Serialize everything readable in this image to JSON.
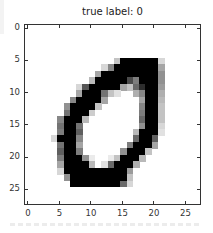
{
  "chart_data": {
    "type": "heatmap",
    "title": "true label: 0",
    "xlabel": "",
    "ylabel": "",
    "colormap": "gray_r",
    "shape": [
      28,
      28
    ],
    "x_ticks": [
      0,
      5,
      10,
      15,
      20,
      25
    ],
    "y_ticks": [
      0,
      5,
      10,
      15,
      20,
      25
    ],
    "xlim": [
      -0.5,
      27.5
    ],
    "ylim": [
      27.5,
      -0.5
    ],
    "grid": false,
    "legend": null,
    "sparse_pixels": {
      "5": {
        "14": 60,
        "15": 255,
        "16": 255,
        "17": 255,
        "18": 255,
        "19": 255,
        "20": 255,
        "21": 40
      },
      "6": {
        "12": 40,
        "13": 120,
        "14": 255,
        "15": 255,
        "16": 255,
        "17": 255,
        "18": 255,
        "19": 255,
        "20": 255,
        "21": 90
      },
      "7": {
        "11": 90,
        "12": 255,
        "13": 255,
        "14": 255,
        "15": 255,
        "16": 255,
        "17": 255,
        "18": 255,
        "19": 255,
        "20": 255,
        "21": 110
      },
      "8": {
        "10": 70,
        "11": 255,
        "12": 255,
        "13": 255,
        "14": 255,
        "15": 255,
        "16": 180,
        "17": 130,
        "18": 255,
        "19": 255,
        "20": 255,
        "21": 110
      },
      "9": {
        "8": 40,
        "9": 170,
        "10": 255,
        "11": 255,
        "12": 255,
        "13": 255,
        "14": 255,
        "15": 90,
        "16": 60,
        "17": 150,
        "18": 210,
        "19": 255,
        "20": 255,
        "21": 100
      },
      "10": {
        "8": 90,
        "9": 255,
        "10": 255,
        "11": 255,
        "12": 140,
        "13": 60,
        "14": 30,
        "17": 80,
        "18": 120,
        "19": 255,
        "20": 255,
        "21": 80
      },
      "11": {
        "7": 120,
        "8": 255,
        "9": 255,
        "10": 255,
        "11": 255,
        "12": 90,
        "18": 90,
        "19": 255,
        "20": 255,
        "21": 70
      },
      "12": {
        "6": 110,
        "7": 255,
        "8": 255,
        "9": 255,
        "10": 255,
        "11": 60,
        "18": 120,
        "19": 255,
        "20": 255,
        "21": 60
      },
      "13": {
        "6": 140,
        "7": 255,
        "8": 255,
        "9": 255,
        "10": 50,
        "18": 130,
        "19": 255,
        "20": 255,
        "21": 60
      },
      "14": {
        "5": 120,
        "6": 255,
        "7": 255,
        "8": 255,
        "9": 70,
        "18": 150,
        "19": 255,
        "20": 255,
        "21": 60
      },
      "15": {
        "5": 140,
        "6": 255,
        "7": 255,
        "8": 140,
        "18": 110,
        "19": 255,
        "20": 255,
        "21": 40
      },
      "16": {
        "5": 130,
        "6": 255,
        "7": 255,
        "8": 160,
        "17": 70,
        "18": 255,
        "19": 255,
        "20": 255,
        "21": 30
      },
      "17": {
        "4": 40,
        "5": 255,
        "6": 255,
        "7": 255,
        "8": 120,
        "17": 150,
        "18": 255,
        "19": 255,
        "20": 160
      },
      "18": {
        "5": 140,
        "6": 255,
        "7": 255,
        "8": 90,
        "16": 130,
        "17": 255,
        "18": 255,
        "19": 255,
        "20": 90
      },
      "19": {
        "5": 160,
        "6": 255,
        "7": 255,
        "8": 130,
        "15": 110,
        "16": 255,
        "17": 255,
        "18": 255,
        "19": 60
      },
      "20": {
        "5": 130,
        "6": 255,
        "7": 255,
        "8": 255,
        "9": 110,
        "10": 20,
        "13": 20,
        "14": 60,
        "15": 255,
        "16": 255,
        "17": 255,
        "18": 70
      },
      "21": {
        "5": 90,
        "6": 255,
        "7": 255,
        "8": 255,
        "9": 255,
        "10": 70,
        "12": 30,
        "13": 150,
        "14": 255,
        "15": 255,
        "16": 255,
        "17": 80
      },
      "22": {
        "5": 40,
        "6": 255,
        "7": 255,
        "8": 255,
        "9": 255,
        "10": 255,
        "11": 255,
        "12": 255,
        "13": 255,
        "14": 255,
        "15": 255,
        "16": 100
      },
      "23": {
        "6": 110,
        "7": 255,
        "8": 255,
        "9": 255,
        "10": 255,
        "11": 255,
        "12": 255,
        "13": 255,
        "14": 255,
        "15": 255,
        "16": 60
      },
      "24": {
        "7": 255,
        "8": 255,
        "9": 255,
        "10": 255,
        "11": 255,
        "12": 255,
        "13": 255,
        "14": 255,
        "15": 150,
        "16": 40
      }
    }
  },
  "labels": {
    "title": "true label: 0",
    "y_tick_labels": [
      "0",
      "5",
      "10",
      "15",
      "20",
      "25"
    ],
    "x_tick_labels": [
      "0",
      "5",
      "10",
      "15",
      "20",
      "25"
    ]
  }
}
